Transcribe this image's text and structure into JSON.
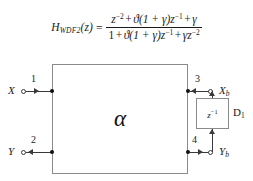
{
  "equation": {
    "lhs_base": "H",
    "lhs_sub": "WDF2",
    "lhs_arg": "(z)",
    "equals": "=",
    "numerator": {
      "t1_base": "z",
      "t1_sup": "−2",
      "op1": "+",
      "t2": "ϑ(1 + γ)z",
      "t2_sup": "−1",
      "op2": "+",
      "t3": "γ"
    },
    "denominator": {
      "t1": "1",
      "op1": "+",
      "t2": "ϑ(1 + γ)z",
      "t2_sup": "−1",
      "op2": "+",
      "t3": "γz",
      "t3_sup": "−2"
    },
    "plain_text": "H_WDF2(z) = (z^-2 + ϑ(1+γ)z^-1 + γ) / (1 + ϑ(1+γ)z^-1 + γz^-2)"
  },
  "diagram": {
    "adaptor": {
      "symbol": "α",
      "name": "alpha-adaptor"
    },
    "delay": {
      "inner_base": "z",
      "inner_sup": "−1",
      "label_base": "D",
      "label_sub": "1"
    },
    "ports": [
      {
        "number": "1",
        "signal_base": "X",
        "signal_sub": "",
        "side": "left",
        "direction": "in"
      },
      {
        "number": "2",
        "signal_base": "Y",
        "signal_sub": "",
        "side": "left",
        "direction": "out"
      },
      {
        "number": "3",
        "signal_base": "X",
        "signal_sub": "b",
        "side": "right",
        "direction": "in"
      },
      {
        "number": "4",
        "signal_base": "Y",
        "signal_sub": "b",
        "side": "right",
        "direction": "out"
      }
    ],
    "colors": {
      "line": "#3a3a3a",
      "box_border": "#8a8a8a",
      "text": "#1a1a1a",
      "background": "#ffffff"
    }
  }
}
